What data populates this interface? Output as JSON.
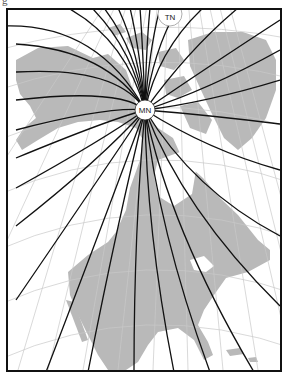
{
  "caption_fragment": "g",
  "map": {
    "title": "Magnetic declination lines over North America",
    "labels": {
      "true_north": "TN",
      "magnetic_north": "MN"
    },
    "poles": {
      "magnetic_north": {
        "x": 137,
        "y": 100,
        "r": 10
      },
      "true_north": {
        "x": 162,
        "y": 4,
        "r": 12
      }
    },
    "colors": {
      "land": "#b9b9b9",
      "water": "#ffffff",
      "graticule": "#c8c8c8",
      "isogonic_lines": "#111111",
      "frame": "#111111"
    },
    "isogonic_line_count": 30
  }
}
